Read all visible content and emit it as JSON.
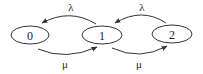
{
  "diagram": {
    "type": "state-transition (birth-death chain)",
    "nodes": [
      {
        "id": "0",
        "label": "0"
      },
      {
        "id": "1",
        "label": "1"
      },
      {
        "id": "2",
        "label": "2"
      }
    ],
    "edges": [
      {
        "from": "1",
        "to": "0",
        "label": "λ",
        "position": "top"
      },
      {
        "from": "2",
        "to": "1",
        "label": "λ",
        "position": "top"
      },
      {
        "from": "0",
        "to": "1",
        "label": "μ",
        "position": "bottom"
      },
      {
        "from": "1",
        "to": "2",
        "label": "μ",
        "position": "bottom"
      }
    ]
  },
  "colors": {
    "stroke": "#333333",
    "background": "#ffffff"
  }
}
